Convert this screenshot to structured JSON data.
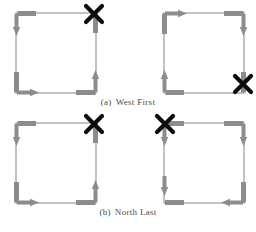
{
  "figure": {
    "type": "turn-model-diagram",
    "colors": {
      "thin_line": "#9a9a9a",
      "arrow_gray": "#8c8c8c",
      "arrow_gray_dark": "#6f6f6f",
      "x_mark": "#0d0d0d",
      "caption_text": "#4a4a4a",
      "background": "#ffffff"
    },
    "geometry": {
      "square_size": 80,
      "thin_stroke": 1.2,
      "thick_stroke": 5,
      "stub_length": 20,
      "arrow_head": 6
    }
  },
  "captions": [
    {
      "label": "(a)",
      "text": "West First",
      "y": 97
    },
    {
      "label": "(b)",
      "text": "North Last",
      "y": 207
    }
  ],
  "panels": [
    {
      "id": "panel-a-left",
      "name": "west-first-left",
      "origin": {
        "x": 16,
        "y": 13
      },
      "x_mark": {
        "corner": "top-right",
        "present": true
      },
      "turns": [
        {
          "corner": "top-left",
          "in_edge": "top",
          "in_dir": "west",
          "out_edge": "left",
          "out_dir": "south",
          "arrow_at": "left-down"
        },
        {
          "corner": "bottom-left",
          "in_edge": "left",
          "in_dir": "south",
          "out_edge": "bottom",
          "out_dir": "east",
          "arrow_at": "bottom-right"
        },
        {
          "corner": "bottom-right",
          "in_edge": "bottom",
          "in_dir": "east",
          "out_edge": "right",
          "out_dir": "north",
          "arrow_at": "right-up"
        },
        {
          "corner": "top-right",
          "in_edge": "right",
          "in_dir": "north",
          "out_edge": "none",
          "out_dir": "none",
          "arrow_at": "none"
        }
      ]
    },
    {
      "id": "panel-a-right",
      "name": "west-first-right",
      "origin": {
        "x": 164,
        "y": 13
      },
      "x_mark": {
        "corner": "bottom-right",
        "present": true
      },
      "turns": [
        {
          "corner": "top-left",
          "in_edge": "left",
          "in_dir": "north",
          "out_edge": "top",
          "out_dir": "east",
          "arrow_at": "top-right"
        },
        {
          "corner": "top-right",
          "in_edge": "top",
          "in_dir": "east",
          "out_edge": "right",
          "out_dir": "south",
          "arrow_at": "right-down"
        },
        {
          "corner": "bottom-left",
          "in_edge": "bottom",
          "in_dir": "west",
          "out_edge": "left",
          "out_dir": "north",
          "arrow_at": "left-up"
        },
        {
          "corner": "bottom-right",
          "in_edge": "right",
          "in_dir": "south",
          "out_edge": "none",
          "out_dir": "none",
          "arrow_at": "none"
        }
      ]
    },
    {
      "id": "panel-b-left",
      "name": "north-last-left",
      "origin": {
        "x": 16,
        "y": 123
      },
      "x_mark": {
        "corner": "top-right",
        "present": true
      },
      "turns": [
        {
          "corner": "top-left",
          "in_edge": "top",
          "in_dir": "west",
          "out_edge": "left",
          "out_dir": "south",
          "arrow_at": "left-down"
        },
        {
          "corner": "bottom-left",
          "in_edge": "left",
          "in_dir": "south",
          "out_edge": "bottom",
          "out_dir": "east",
          "arrow_at": "bottom-right"
        },
        {
          "corner": "bottom-right",
          "in_edge": "bottom",
          "in_dir": "east",
          "out_edge": "right",
          "out_dir": "north",
          "arrow_at": "right-up"
        },
        {
          "corner": "top-right",
          "in_edge": "right",
          "in_dir": "north",
          "out_edge": "none",
          "out_dir": "none",
          "arrow_at": "none"
        }
      ]
    },
    {
      "id": "panel-b-right",
      "name": "north-last-right",
      "origin": {
        "x": 164,
        "y": 123
      },
      "x_mark": {
        "corner": "top-left",
        "present": true
      },
      "turns": [
        {
          "corner": "top-left",
          "in_edge": "top",
          "in_dir": "west",
          "out_edge": "left",
          "out_dir": "south",
          "arrow_at": "left-down"
        },
        {
          "corner": "top-right",
          "in_edge": "top",
          "in_dir": "east",
          "out_edge": "right",
          "out_dir": "south",
          "arrow_at": "right-down"
        },
        {
          "corner": "bottom-left",
          "in_edge": "left",
          "in_dir": "south",
          "out_edge": "bottom",
          "out_dir": "east",
          "arrow_at": "bottom-right-short"
        },
        {
          "corner": "bottom-right",
          "in_edge": "right",
          "in_dir": "south",
          "out_edge": "bottom",
          "out_dir": "west",
          "arrow_at": "bottom-left"
        }
      ]
    }
  ]
}
